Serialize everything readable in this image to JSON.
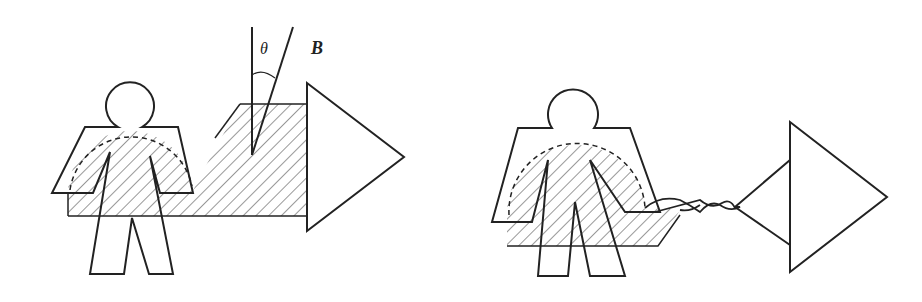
{
  "figure": {
    "panels": [
      {
        "id": "left",
        "description": "Person standing in a hatched magnetic region with field direction B at angle theta, arrow pointing right",
        "labels": {
          "angle": "θ",
          "field": "B"
        }
      },
      {
        "id": "right",
        "description": "Person in hatched region holding a twisted-pair wire leading to arrow shape"
      }
    ],
    "colors": {
      "stroke": "#222222",
      "background": "#ffffff"
    }
  }
}
